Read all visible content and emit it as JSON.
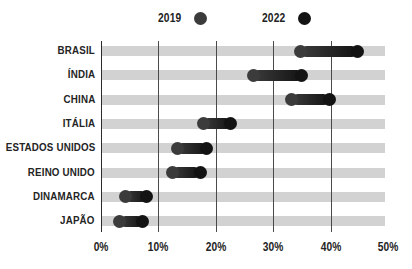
{
  "legend": {
    "items": [
      {
        "label": "2019",
        "color": "#3b3b3b",
        "icon": "circle-icon"
      },
      {
        "label": "2022",
        "color": "#131313",
        "icon": "circle-icon"
      }
    ]
  },
  "axis": {
    "x_ticks": [
      "0%",
      "10%",
      "20%",
      "30%",
      "40%",
      "50%"
    ]
  },
  "chart_data": {
    "type": "scatter",
    "subtype": "dumbbell",
    "title": "",
    "xlabel": "",
    "ylabel": "",
    "xlim": [
      0,
      50
    ],
    "xtick_values": [
      0,
      10,
      20,
      30,
      40,
      50
    ],
    "xtick_labels": [
      "0%",
      "10%",
      "20%",
      "30%",
      "40%",
      "50%"
    ],
    "grid": "vertical-gridlines-at-0-10-20-30-40",
    "legend_position": "top",
    "categories": [
      "BRASIL",
      "ÍNDIA",
      "CHINA",
      "ITÁLIA",
      "ESTADOS UNIDOS",
      "REINO UNIDO",
      "DINAMARCA",
      "JAPÃO"
    ],
    "series": [
      {
        "name": "2019",
        "color": "#3b3b3b",
        "values": [
          34.8,
          26.5,
          33.2,
          17.8,
          13.3,
          12.4,
          4.2,
          3.3
        ]
      },
      {
        "name": "2022",
        "color": "#131313",
        "values": [
          44.6,
          35.0,
          39.8,
          22.6,
          18.4,
          17.3,
          8.0,
          7.3
        ]
      }
    ],
    "rows": [
      {
        "category": "BRASIL",
        "v2019": 34.8,
        "v2022": 44.6
      },
      {
        "category": "ÍNDIA",
        "v2019": 26.5,
        "v2022": 35.0
      },
      {
        "category": "CHINA",
        "v2019": 33.2,
        "v2022": 39.8
      },
      {
        "category": "ITÁLIA",
        "v2019": 17.8,
        "v2022": 22.6
      },
      {
        "category": "ESTADOS UNIDOS",
        "v2019": 13.3,
        "v2022": 18.4
      },
      {
        "category": "REINO UNIDO",
        "v2019": 12.4,
        "v2022": 17.3
      },
      {
        "category": "DINAMARCA",
        "v2019": 4.2,
        "v2022": 8.0
      },
      {
        "category": "JAPÃO",
        "v2019": 3.3,
        "v2022": 7.3
      }
    ]
  },
  "colors": {
    "band": "#d2d2d2",
    "axis": "#2b2b2b",
    "gridline": "#4a4a4a",
    "background": "#ffffff",
    "text": "#242424"
  }
}
